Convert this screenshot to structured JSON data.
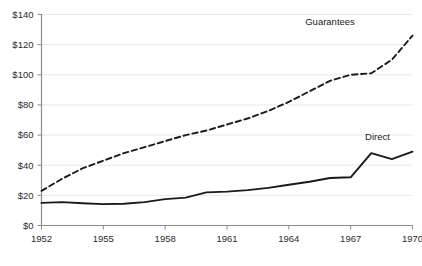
{
  "chart_data": {
    "type": "line",
    "title": "",
    "xlabel": "",
    "ylabel": "",
    "xlim": [
      1952,
      1970
    ],
    "ylim": [
      0,
      140
    ],
    "grid": true,
    "legend_position": "inline-labels",
    "y_ticks": [
      0,
      20,
      40,
      60,
      80,
      100,
      120,
      140
    ],
    "y_tick_labels": [
      "$0",
      "$20",
      "$40",
      "$60",
      "$80",
      "$100",
      "$120",
      "$140"
    ],
    "x_ticks": [
      1952,
      1955,
      1958,
      1961,
      1964,
      1967,
      1970
    ],
    "x_tick_labels": [
      "1952",
      "1955",
      "1958",
      "1961",
      "1964",
      "1967",
      "1970"
    ],
    "x": [
      1952,
      1953,
      1954,
      1955,
      1956,
      1957,
      1958,
      1959,
      1960,
      1961,
      1962,
      1963,
      1964,
      1965,
      1966,
      1967,
      1968,
      1969,
      1970
    ],
    "series": [
      {
        "name": "Guarantees",
        "style": "dashed",
        "color": "#1a1a1a",
        "label_x": 1966,
        "label_y": 133,
        "values": [
          23,
          31,
          38,
          43,
          48,
          52,
          56,
          60,
          63,
          67,
          71,
          76,
          82,
          89,
          96,
          100,
          101,
          110,
          126
        ]
      },
      {
        "name": "Direct",
        "style": "solid",
        "color": "#1a1a1a",
        "label_x": 1968.3,
        "label_y": 57,
        "label_anchor": "middle",
        "values": [
          15,
          15.5,
          14.8,
          14.2,
          14.4,
          15.5,
          17.5,
          18.5,
          22,
          22.5,
          23.5,
          25,
          27,
          29,
          31.5,
          32,
          48,
          44,
          49
        ]
      }
    ]
  },
  "axis_colors": {
    "spine": "#8c8c8c",
    "grid": "#e9e9e9",
    "text": "#2b2b2b",
    "line": "#1a1a1a"
  }
}
